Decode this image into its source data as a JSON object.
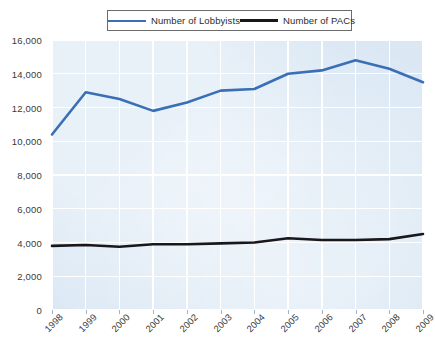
{
  "legend": {
    "position": "top-center",
    "entries": [
      {
        "label": "Number of Lobbyists",
        "color": "#3A6FB5",
        "icon": "line-swatch-icon"
      },
      {
        "label": "Number of PACs",
        "color": "#17171C",
        "icon": "line-swatch-icon"
      }
    ]
  },
  "axes": {
    "y_ticks": [
      "0",
      "2,000",
      "4,000",
      "6,000",
      "8,000",
      "10,000",
      "12,000",
      "14,000",
      "16,000"
    ],
    "x_ticks": [
      "1998",
      "1999",
      "2000",
      "2001",
      "2002",
      "2003",
      "2004",
      "2005",
      "2006",
      "2007",
      "2008",
      "2009"
    ]
  },
  "style": {
    "plot_background": "#DBE8F4",
    "gridline_color": "#FFFFFF",
    "page_background": "#FFFFFF",
    "legend_border": "#6B6B6B"
  },
  "chart_data": {
    "type": "line",
    "title": "",
    "subtitle": "",
    "xlabel": "",
    "ylabel": "",
    "x": [
      "1998",
      "1999",
      "2000",
      "2001",
      "2002",
      "2003",
      "2004",
      "2005",
      "2006",
      "2007",
      "2008",
      "2009"
    ],
    "categories": [
      "1998",
      "1999",
      "2000",
      "2001",
      "2002",
      "2003",
      "2004",
      "2005",
      "2006",
      "2007",
      "2008",
      "2009"
    ],
    "ylim": [
      0,
      16000
    ],
    "ytick_step": 2000,
    "grid": true,
    "legend_position": "top",
    "series": [
      {
        "name": "Number of Lobbyists",
        "color": "#3A6FB5",
        "values": [
          10400,
          12900,
          12500,
          11800,
          12300,
          13000,
          13100,
          14000,
          14200,
          14800,
          14300,
          13500
        ]
      },
      {
        "name": "Number of PACs",
        "color": "#17171C",
        "values": [
          3800,
          3850,
          3750,
          3900,
          3900,
          3950,
          4000,
          4250,
          4150,
          4150,
          4200,
          4500
        ]
      }
    ]
  }
}
